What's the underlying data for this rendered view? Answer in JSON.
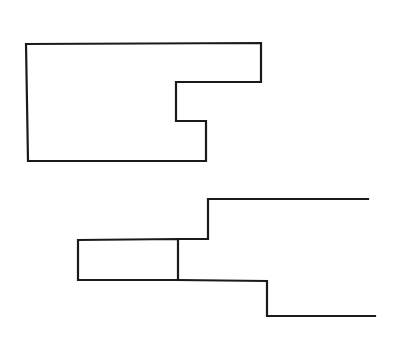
{
  "diagram": {
    "background": "#ffffff",
    "stroke_color": "#1a1a1a",
    "shapes": [
      {
        "id": "upper-notched-outline",
        "description": "Closed rectilinear outline with a stepped notch on the right side",
        "points": "26,44 261,43 261,82 176,82 176,121 206,121 206,161 28,161 26,44"
      },
      {
        "id": "lower-left-box",
        "description": "Closed rectangle on the left of the lower figure",
        "points": "78,240 178,239 178,280 78,280 78,240"
      },
      {
        "id": "lower-upper-stepped-line",
        "description": "Open line stepping up and extending right",
        "points": "178,239 208,239 208,199 368,199"
      },
      {
        "id": "lower-lower-stepped-line",
        "description": "Open line stepping down and extending right",
        "points": "178,280 267,281 267,316 375,316"
      }
    ]
  }
}
